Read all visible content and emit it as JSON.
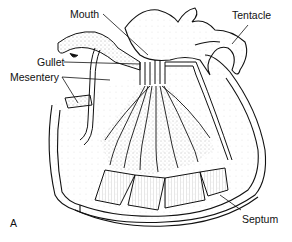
{
  "figure": {
    "panel_letter": "A",
    "labels": {
      "mouth": "Mouth",
      "tentacle": "Tentacle",
      "gullet": "Gullet",
      "mesentery": "Mesentery",
      "septum": "Septum"
    },
    "colors": {
      "ink": "#111111",
      "background": "#ffffff",
      "stipple": "#555555"
    }
  }
}
